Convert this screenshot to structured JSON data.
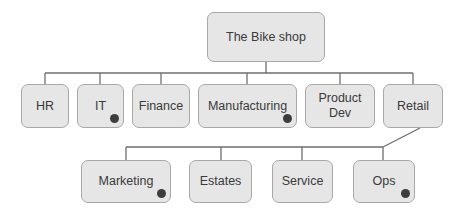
{
  "diagram": {
    "type": "org-chart",
    "root": {
      "id": "root",
      "label": "The Bike shop",
      "x": 207,
      "y": 12,
      "w": 118,
      "h": 50,
      "dot": false
    },
    "level1": [
      {
        "id": "hr",
        "label": "HR",
        "x": 21,
        "y": 84,
        "w": 48,
        "h": 44,
        "dot": false
      },
      {
        "id": "it",
        "label": "IT",
        "x": 77,
        "y": 84,
        "w": 47,
        "h": 44,
        "dot": true
      },
      {
        "id": "finance",
        "label": "Finance",
        "x": 132,
        "y": 84,
        "w": 58,
        "h": 44,
        "dot": false
      },
      {
        "id": "manufacturing",
        "label": "Manufacturing",
        "x": 198,
        "y": 84,
        "w": 99,
        "h": 44,
        "dot": true
      },
      {
        "id": "product-dev",
        "label": "Product\nDev",
        "x": 305,
        "y": 84,
        "w": 70,
        "h": 44,
        "dot": false
      },
      {
        "id": "retail",
        "label": "Retail",
        "x": 383,
        "y": 84,
        "w": 60,
        "h": 44,
        "dot": false
      }
    ],
    "level2_parent": "Retail",
    "level2": [
      {
        "id": "marketing",
        "label": "Marketing",
        "x": 81,
        "y": 160,
        "w": 90,
        "h": 43,
        "dot": true
      },
      {
        "id": "estates",
        "label": "Estates",
        "x": 189,
        "y": 160,
        "w": 63,
        "h": 43,
        "dot": false
      },
      {
        "id": "service",
        "label": "Service",
        "x": 272,
        "y": 160,
        "w": 61,
        "h": 43,
        "dot": false
      },
      {
        "id": "ops",
        "label": "Ops",
        "x": 353,
        "y": 160,
        "w": 62,
        "h": 43,
        "dot": true
      }
    ],
    "colors": {
      "box_fill": "#e6e6e6",
      "box_border": "#a8a8a8",
      "line": "#6e6e6e",
      "dot": "#3d3d3d",
      "text": "#3a3a3a"
    }
  }
}
